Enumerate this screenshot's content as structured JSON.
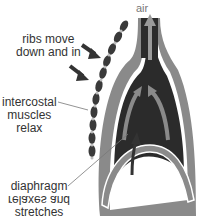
{
  "diagram": {
    "labels": {
      "air": "air",
      "ribs": [
        "ribs move",
        "down and in"
      ],
      "intercostal": [
        "intercostal",
        "muscles",
        "relax"
      ],
      "diaphragm": [
        "diaphragm",
        "relaxes and",
        "stretches"
      ]
    },
    "colors": {
      "lung_dark": "#2b2b2b",
      "tissue_gray": "#8a8a8a",
      "outline_white": "#ffffff",
      "arrow_gray": "#9a9a9a",
      "label_text": "#333333",
      "rib_dark": "#3a3a3a",
      "rib_light": "#bdbdbd"
    }
  }
}
